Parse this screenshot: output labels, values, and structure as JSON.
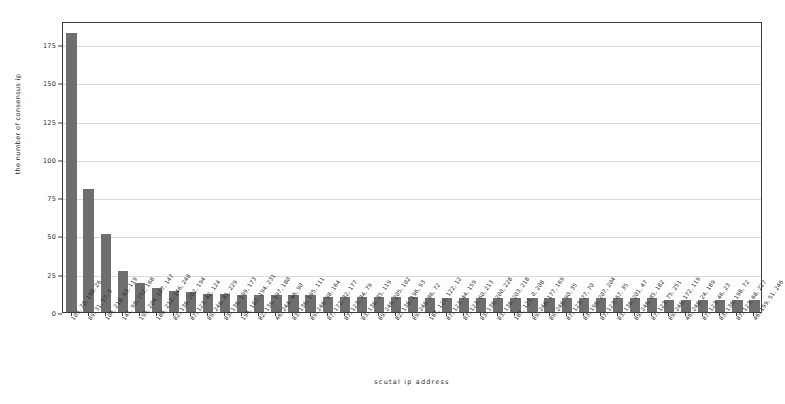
{
  "chart_data": {
    "type": "bar",
    "title": "",
    "xlabel": "scutal ip address",
    "ylabel": "the number of consensus ip",
    "ylim": [
      0,
      190
    ],
    "yticks": [
      0,
      25,
      50,
      75,
      100,
      125,
      150,
      175
    ],
    "grid": true,
    "legend": null,
    "bar_color": "#6e6e6e",
    "categories": [
      "109, 70, 198, 26",
      "89, 31, 57, 5",
      "104, 218, 63, 119",
      "141, 98, 252, 168",
      "195, 204, 107, 147",
      "186, 212, 146, 248",
      "82, 136, 202, 194",
      "87, 123, 42, 124",
      "89, 246, 85, 229",
      "83, 136, 199, 173",
      "194, 187, 194, 231",
      "82, 136, 197, 180",
      "46, 244, 46, 90",
      "83, 136, 195, 111",
      "89, 246, 98, 164",
      "87, 172, 32, 177",
      "87, 123, 34, 79",
      "83, 136, 35, 119",
      "89, 246, 205, 102",
      "82, 136, 196, 93",
      "89, 246, 86, 72",
      "187, 121, 122, 12",
      "87, 123, 44, 159",
      "87, 123, 60, 213",
      "83, 136, 200, 228",
      "83, 136, 203, 218",
      "187, 121, 0, 208",
      "89, 246, 177, 169",
      "89, 246, 90, 35",
      "87, 123, 77, 70",
      "83, 196, 207, 204",
      "87, 123, 67, 35",
      "83, 136, 201, 47",
      "89, 246, 85, 182",
      "87, 123, 75, 251",
      "89, 246, 172, 119",
      "46, 246, 24, 189",
      "87, 123, 46, 23",
      "83, 136, 198, 72",
      "87, 123, 68, 227",
      "46, 199, 51, 246"
    ],
    "values": [
      182,
      80,
      51,
      27,
      19,
      16,
      14,
      13,
      12,
      12,
      11,
      11,
      11,
      11,
      11,
      10,
      10,
      10,
      10,
      10,
      10,
      9,
      9,
      9,
      9,
      9,
      9,
      9,
      9,
      9,
      9,
      9,
      9,
      9,
      9,
      8,
      8,
      8,
      8,
      8,
      8
    ]
  }
}
